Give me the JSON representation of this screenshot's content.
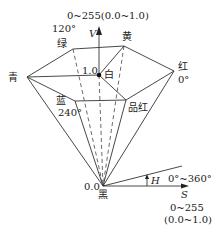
{
  "diagram": {
    "type": "HSV hexcone",
    "v_axis": {
      "range_label": "0~255(0.0~1.0)",
      "symbol": "V"
    },
    "vertices": {
      "green": {
        "label": "绿",
        "angle": "120°"
      },
      "yellow": {
        "label": "黄"
      },
      "red": {
        "label": "红",
        "angle": "0°"
      },
      "magenta": {
        "label": "品红"
      },
      "blue": {
        "label": "蓝",
        "angle": "240°"
      },
      "cyan": {
        "label": "青"
      }
    },
    "white": {
      "label": "白",
      "value": "1.0"
    },
    "black": {
      "label": "黑",
      "value": "0.0"
    },
    "h_axis": {
      "symbol": "H",
      "range_label": "0°~360°"
    },
    "s_axis": {
      "symbol": "S",
      "range_label": "0~255",
      "range_label_norm": "(0.0~1.0)"
    }
  }
}
